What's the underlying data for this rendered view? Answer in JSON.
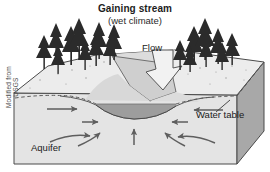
{
  "figure": {
    "title": "Gaining stream",
    "subtitle": "(wet climate)",
    "credit": "Modified from USGS",
    "labels": {
      "flow": "Flow",
      "water_table": "Water table",
      "aquifer": "Aquifer"
    },
    "icons": {
      "flow_arrow": "flow-arrow-icon",
      "tree": "conifer-tree-icon",
      "groundwater_arrow": "groundwater-flow-arrow-icon",
      "leader_line": "leader-line-icon",
      "water_table_line": "dashed-water-table-line-icon"
    },
    "colors": {
      "background": "#ffffff",
      "block_top": "#ececec",
      "block_front": "#e4e4e4",
      "block_right": "#a8a8a8",
      "valley_slope": "#cfcfcf",
      "stream_water": "#9d9d9d",
      "outline": "#4a4a4a",
      "arrow": "#5e5e5e",
      "tree": "#2b2b2b",
      "text": "#1a1a1a",
      "flow_arrow_fill": "#f2f2f2"
    }
  }
}
